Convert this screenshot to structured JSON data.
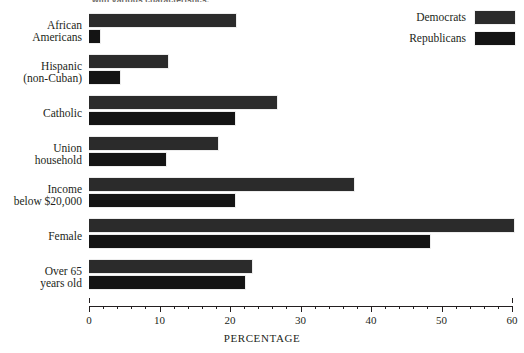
{
  "chart_data": {
    "type": "bar",
    "orientation": "horizontal",
    "title": "with various characteristics.",
    "xlabel": "PERCENTAGE",
    "ylabel": "",
    "xlim": [
      0,
      60
    ],
    "xticks": [
      0,
      10,
      20,
      30,
      40,
      50,
      60
    ],
    "xtick_labels": [
      "0",
      "10",
      "20",
      "30",
      "40",
      "50",
      "60"
    ],
    "minor_tick_step": 2,
    "grid": false,
    "legend_position": "top-right",
    "categories": [
      "African Americans",
      "Hispanic (non-Cuban)",
      "Catholic",
      "Union household",
      "Income below $20,000",
      "Female",
      "Over 65 years old"
    ],
    "category_lines": [
      [
        "African",
        "Americans"
      ],
      [
        "Hispanic",
        "(non-Cuban)"
      ],
      [
        "Catholic"
      ],
      [
        "Union",
        "household"
      ],
      [
        "Income",
        "below $20,000"
      ],
      [
        "Female"
      ],
      [
        "Over 65",
        "years old"
      ]
    ],
    "series": [
      {
        "name": "Democrats",
        "color": "#2b2b2b",
        "values": [
          21.0,
          11.3,
          26.8,
          18.5,
          37.8,
          60.4,
          23.2
        ]
      },
      {
        "name": "Republicans",
        "color": "#141414",
        "values": [
          1.7,
          4.5,
          20.9,
          11.1,
          20.9,
          48.5,
          22.3
        ]
      }
    ]
  },
  "legend": {
    "items": [
      {
        "label": "Democrats",
        "color": "#2b2b2b"
      },
      {
        "label": "Republicans",
        "color": "#141414"
      }
    ]
  },
  "colors": {
    "background": "#ffffff",
    "ink": "#231f20",
    "democrat": "#2b2b2b",
    "republican": "#141414"
  }
}
